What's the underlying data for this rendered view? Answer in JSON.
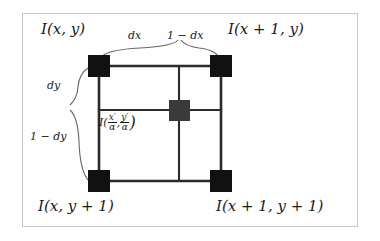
{
  "figure": {
    "type": "bilinear-interpolation-diagram",
    "frame": {
      "stroke": "#c9c9c9",
      "background": "#fefefe"
    },
    "colors": {
      "corner_node": "#111111",
      "interior_node": "#3a3a3a",
      "grid_line": "#2b2b2b",
      "brace": "#555555",
      "text": "#1b1b1b"
    },
    "corner_labels": {
      "top_left": "I(x, y)",
      "top_right": "I(x + 1, y)",
      "bottom_left": "I(x, y + 1)",
      "bottom_right": "I(x + 1, y + 1)"
    },
    "fraction_labels": {
      "dx": "dx",
      "one_minus_dx": "1 − dx",
      "dy": "dy",
      "one_minus_dy": "1 − dy"
    },
    "center_label": {
      "prefix": "I(",
      "x_numerator": "x′",
      "x_denominator": "α",
      "separator": ",",
      "y_numerator": "y′",
      "y_denominator": "α",
      "suffix": ")"
    },
    "nodes": [
      {
        "name": "corner-top-left",
        "x": 99,
        "y": 66,
        "size": 22,
        "fill": "#111111"
      },
      {
        "name": "corner-top-right",
        "x": 221,
        "y": 66,
        "size": 22,
        "fill": "#111111"
      },
      {
        "name": "corner-bottom-left",
        "x": 99,
        "y": 181,
        "size": 22,
        "fill": "#111111"
      },
      {
        "name": "corner-bottom-right",
        "x": 221,
        "y": 181,
        "size": 22,
        "fill": "#111111"
      },
      {
        "name": "interior-sample",
        "x": 179,
        "y": 110,
        "size": 21,
        "fill": "#3a3a3a"
      }
    ]
  }
}
